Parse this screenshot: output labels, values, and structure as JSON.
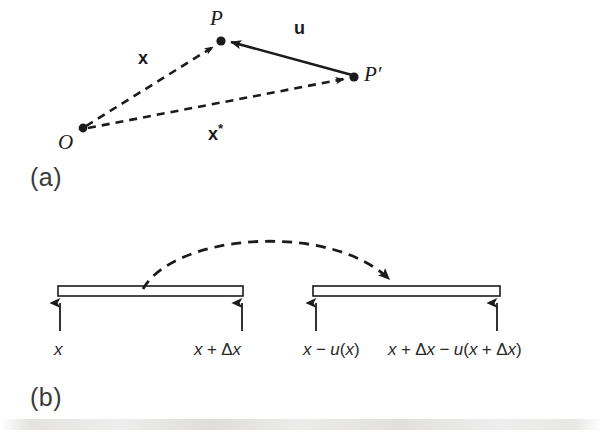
{
  "figure": {
    "type": "diagram",
    "background_color": "#ffffff",
    "ink_color": "#1b1b1b"
  },
  "panels": [
    {
      "id": "a",
      "label": "(a)",
      "title": "position vectors and displacement vector",
      "points": [
        {
          "name": "O",
          "label": "O",
          "x": 83,
          "y": 128,
          "label_x": 58,
          "label_y": 130
        },
        {
          "name": "P",
          "label": "P",
          "x": 221,
          "y": 41,
          "label_x": 210,
          "label_y": 6
        },
        {
          "name": "P-prime",
          "label": "P′",
          "x": 354,
          "y": 77,
          "label_x": 364,
          "label_y": 62
        }
      ],
      "vectors": [
        {
          "name": "x",
          "label": "x",
          "style": "dashed",
          "from": "O",
          "to": "P",
          "label_x": 138,
          "label_y": 48,
          "superscript": ""
        },
        {
          "name": "x-star",
          "label": "x",
          "style": "dashed",
          "from": "O",
          "to": "P-prime",
          "label_x": 208,
          "label_y": 121,
          "superscript": "*"
        },
        {
          "name": "u",
          "label": "u",
          "style": "solid",
          "from": "P-prime",
          "to": "P",
          "label_x": 294,
          "label_y": 18,
          "superscript": ""
        }
      ]
    },
    {
      "id": "b",
      "label": "(b)",
      "title": "bar before and after displacement",
      "bars": [
        {
          "name": "reference-bar",
          "x_left": 58,
          "x_right": 243,
          "y_top": 286,
          "y_bottom": 296
        },
        {
          "name": "displaced-bar",
          "x_left": 313,
          "x_right": 500,
          "y_top": 286,
          "y_bottom": 296
        }
      ],
      "tick_arrows": [
        {
          "name": "tick-x",
          "x": 60
        },
        {
          "name": "tick-x-plus-dx",
          "x": 242
        },
        {
          "name": "tick-x-minus-ux",
          "x": 316
        },
        {
          "name": "tick-x-plus-dx-minus-u",
          "x": 497
        }
      ],
      "tick_labels": [
        {
          "name": "label-x",
          "text": "x",
          "html": "<i>x</i>",
          "anchor_x": 60,
          "y": 348,
          "align": "left",
          "offset_x": -6
        },
        {
          "name": "label-x-plus-delta-x",
          "text": "x + Δx",
          "html": "<i>x</i><span class=\"op\"> + </span><span class=\"delta\">Δ</span><i>x</i>",
          "anchor_x": 242,
          "y": 348,
          "align": "right",
          "offset_x": 18
        },
        {
          "name": "label-x-minus-u-x",
          "text": "x − u(x)",
          "html": "<i>x</i><span class=\"op\"> − </span><i>u</i>(<i>x</i>)",
          "anchor_x": 316,
          "y": 348,
          "align": "left",
          "offset_x": -10
        },
        {
          "name": "label-x-plus-delta-x-minus-u",
          "text": "x + Δx − u(x + Δx)",
          "html": "<i>x</i><span class=\"op\"> + </span><span class=\"delta\">Δ</span><i>x</i><span class=\"op\"> − </span><i>u</i>(<i>x</i><span class=\"op\"> + </span><span class=\"delta\">Δ</span><i>x</i>)",
          "anchor_x": 497,
          "y": 348,
          "align": "right",
          "offset_x": 22
        }
      ],
      "mapping_arc": {
        "name": "displacement-arc",
        "style": "dashed",
        "start_x": 143,
        "start_y": 288,
        "end_x": 393,
        "end_y": 284,
        "peak_y": 236,
        "arrowhead": "end"
      }
    }
  ]
}
